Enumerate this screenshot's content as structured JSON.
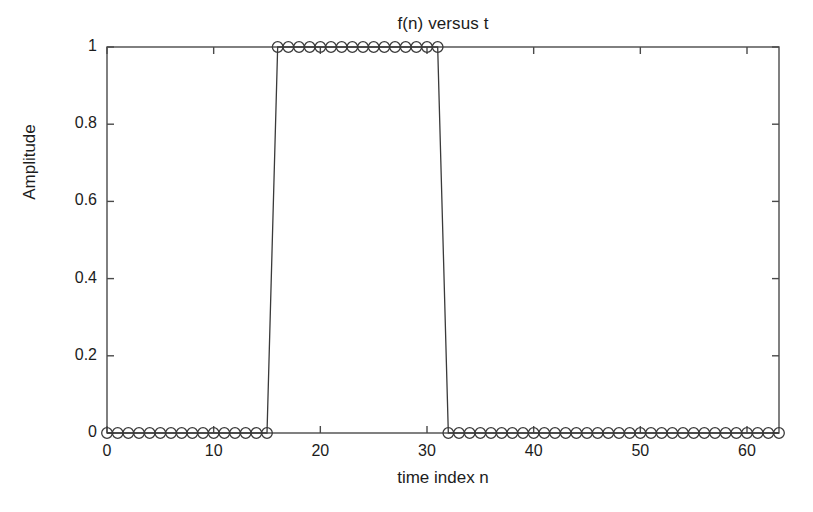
{
  "chart_data": {
    "type": "line",
    "title": "f(n) versus t",
    "xlabel": "time index n",
    "ylabel": "Amplitude",
    "marker": "circle-open",
    "line_color": "#3a3a3a",
    "marker_color": "#3a3a3a",
    "background_color": "#ffffff",
    "grid": false,
    "legend": null,
    "xlim": [
      0,
      63
    ],
    "ylim": [
      0,
      1
    ],
    "xticks": [
      0,
      10,
      20,
      30,
      40,
      50,
      60
    ],
    "xtick_labels": [
      "0",
      "10",
      "20",
      "30",
      "40",
      "50",
      "60"
    ],
    "yticks": [
      0,
      0.2,
      0.4,
      0.6,
      0.8,
      1
    ],
    "ytick_labels": [
      "0",
      "0.2",
      "0.4",
      "0.6",
      "0.8",
      "1"
    ],
    "x": [
      0,
      1,
      2,
      3,
      4,
      5,
      6,
      7,
      8,
      9,
      10,
      11,
      12,
      13,
      14,
      15,
      16,
      17,
      18,
      19,
      20,
      21,
      22,
      23,
      24,
      25,
      26,
      27,
      28,
      29,
      30,
      31,
      32,
      33,
      34,
      35,
      36,
      37,
      38,
      39,
      40,
      41,
      42,
      43,
      44,
      45,
      46,
      47,
      48,
      49,
      50,
      51,
      52,
      53,
      54,
      55,
      56,
      57,
      58,
      59,
      60,
      61,
      62,
      63
    ],
    "values": [
      0,
      0,
      0,
      0,
      0,
      0,
      0,
      0,
      0,
      0,
      0,
      0,
      0,
      0,
      0,
      0,
      1,
      1,
      1,
      1,
      1,
      1,
      1,
      1,
      1,
      1,
      1,
      1,
      1,
      1,
      1,
      1,
      0,
      0,
      0,
      0,
      0,
      0,
      0,
      0,
      0,
      0,
      0,
      0,
      0,
      0,
      0,
      0,
      0,
      0,
      0,
      0,
      0,
      0,
      0,
      0,
      0,
      0,
      0,
      0,
      0,
      0,
      0,
      0
    ]
  }
}
